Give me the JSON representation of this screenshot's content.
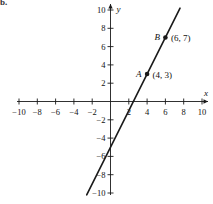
{
  "figure": {
    "part_label": "b.",
    "background_color": "#ffffff",
    "ink_color": "#1a1a1a"
  },
  "chart_data": {
    "type": "line",
    "title": "",
    "xlabel": "x",
    "ylabel": "y",
    "xlim": [
      -10,
      10
    ],
    "ylim": [
      -10,
      10
    ],
    "grid": false,
    "legend": "none",
    "x_ticks": [
      -10,
      -8,
      -6,
      -4,
      -2,
      2,
      4,
      6,
      8,
      10
    ],
    "y_ticks": [
      -10,
      -8,
      -6,
      -4,
      -2,
      2,
      4,
      6,
      8,
      10
    ],
    "x_tick_labels": [
      "-10",
      "-8",
      "-6",
      "-4",
      "-2",
      "2",
      "4",
      "6",
      "8",
      "10"
    ],
    "y_tick_labels": [
      "-10",
      "-8",
      "-6",
      "-4",
      "-2",
      "2",
      "4",
      "6",
      "8",
      "10"
    ],
    "series": [
      {
        "name": "line-through-A-and-B",
        "slope": 2,
        "y_intercept": -5,
        "x_intercept": 2.5,
        "x_start": -2.6,
        "y_start": -10.2,
        "x_end": 7.6,
        "y_end": 10.2
      }
    ],
    "points": [
      {
        "name": "A",
        "label": "A",
        "coord_label": "(4, 3)",
        "x": 4,
        "y": 3
      },
      {
        "name": "B",
        "label": "B",
        "coord_label": "(6, 7)",
        "x": 6,
        "y": 7
      }
    ],
    "axis_arrow_labels": {
      "x": "x",
      "y": "y"
    }
  }
}
